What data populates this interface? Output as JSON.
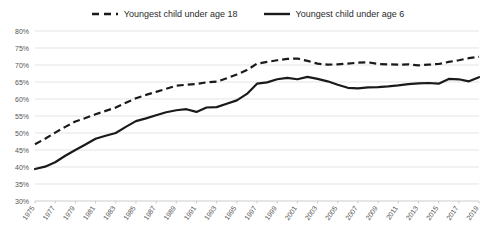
{
  "chart_data": {
    "type": "line",
    "title": "",
    "xlabel": "",
    "ylabel": "",
    "ylim": [
      30,
      80
    ],
    "ytick_labels": [
      "80%",
      "75%",
      "70%",
      "65%",
      "60%",
      "55%",
      "50%",
      "45%",
      "40%",
      "35%",
      "30%"
    ],
    "ytick_values": [
      80,
      75,
      70,
      65,
      60,
      55,
      50,
      45,
      40,
      35,
      30
    ],
    "grid": true,
    "legend_position": "top-center",
    "x": [
      1975,
      1976,
      1977,
      1978,
      1979,
      1980,
      1981,
      1982,
      1983,
      1984,
      1985,
      1986,
      1987,
      1988,
      1989,
      1990,
      1991,
      1992,
      1993,
      1994,
      1995,
      1996,
      1997,
      1998,
      1999,
      2000,
      2001,
      2002,
      2003,
      2004,
      2005,
      2006,
      2007,
      2008,
      2009,
      2010,
      2011,
      2012,
      2013,
      2014,
      2015,
      2016,
      2017,
      2018,
      2019
    ],
    "xtick_labels": [
      "1975",
      "1977",
      "1979",
      "1981",
      "1983",
      "1985",
      "1987",
      "1989",
      "1991",
      "1993",
      "1995",
      "1997",
      "1999",
      "2001",
      "2003",
      "2005",
      "2007",
      "2009",
      "2011",
      "2013",
      "2015",
      "2017",
      "2019"
    ],
    "series": [
      {
        "name": "Youngest child under age 18",
        "style": "dashed",
        "color": "#1a1a1a",
        "values": [
          46.7,
          48.3,
          50.1,
          51.8,
          53.4,
          54.4,
          55.5,
          56.5,
          57.5,
          58.9,
          60.2,
          61.2,
          62.1,
          63.0,
          63.9,
          64.2,
          64.4,
          64.9,
          65.1,
          66.1,
          67.2,
          68.5,
          70.4,
          70.9,
          71.4,
          71.8,
          71.9,
          71.2,
          70.4,
          70.1,
          70.2,
          70.4,
          70.7,
          70.8,
          70.3,
          70.2,
          70.1,
          70.2,
          69.9,
          70.1,
          70.3,
          70.9,
          71.4,
          72.0,
          72.4
        ]
      },
      {
        "name": "Youngest child under age 6",
        "style": "solid",
        "color": "#1a1a1a",
        "values": [
          39.4,
          40.1,
          41.4,
          43.3,
          45.0,
          46.6,
          48.3,
          49.2,
          50.0,
          51.8,
          53.5,
          54.3,
          55.2,
          56.1,
          56.7,
          57.0,
          56.2,
          57.5,
          57.6,
          58.6,
          59.6,
          61.5,
          64.5,
          64.9,
          65.8,
          66.2,
          65.8,
          66.5,
          65.9,
          65.2,
          64.2,
          63.3,
          63.1,
          63.4,
          63.5,
          63.7,
          64.0,
          64.4,
          64.6,
          64.7,
          64.5,
          65.9,
          65.8,
          65.2,
          66.4
        ]
      }
    ]
  }
}
